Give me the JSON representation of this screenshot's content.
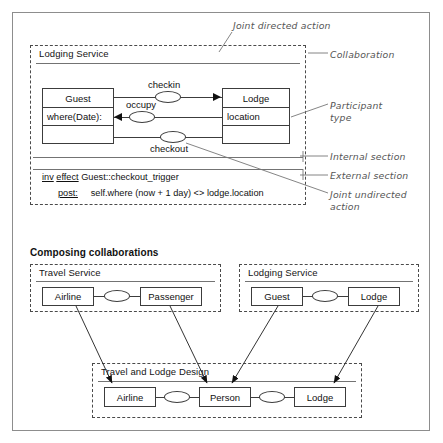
{
  "figure": {
    "top_section": {
      "collaboration_name": "Lodging Service",
      "participants": [
        {
          "name": "Guest",
          "attributes": [
            "where(Date):",
            ""
          ]
        },
        {
          "name": "Lodge",
          "attributes": [
            "location",
            ""
          ]
        }
      ],
      "actions": [
        {
          "label": "checkin",
          "direction": "right",
          "kind": "joint-directed"
        },
        {
          "label": "occupy",
          "direction": "left",
          "kind": "joint-directed"
        },
        {
          "label": "checkout",
          "direction": "none",
          "kind": "joint-undirected"
        }
      ],
      "constraint": {
        "keyword_inv": "inv",
        "keyword_effect": "effect",
        "target": "Guest::checkout_trigger",
        "clause_keyword": "post:",
        "clause_body": "self.where (now + 1 day) <> lodge.location"
      }
    },
    "annotations": [
      {
        "id": "joint-directed-action",
        "text": "Joint directed action"
      },
      {
        "id": "collaboration",
        "text": "Collaboration"
      },
      {
        "id": "participant-type",
        "text": "Participant\ntype"
      },
      {
        "id": "internal-section",
        "text": "Internal section"
      },
      {
        "id": "external-section",
        "text": "External section"
      },
      {
        "id": "joint-undirected-action",
        "text": "Joint undirected\naction"
      }
    ],
    "bottom_section": {
      "heading": "Composing collaborations",
      "collaborations": [
        {
          "name": "Travel Service",
          "participants": [
            "Airline",
            "Passenger"
          ]
        },
        {
          "name": "Lodging Service",
          "participants": [
            "Guest",
            "Lodge"
          ]
        }
      ],
      "composite": {
        "name": "Travel and Lodge Design",
        "participants": [
          "Airline",
          "Person",
          "Lodge"
        ]
      }
    }
  },
  "colors": {
    "frame": "#8d8d8d",
    "dashed": "#4a4a4a",
    "box": "#3c3c3c",
    "rule": "#737373",
    "note": "#555555",
    "text": "#111111"
  }
}
